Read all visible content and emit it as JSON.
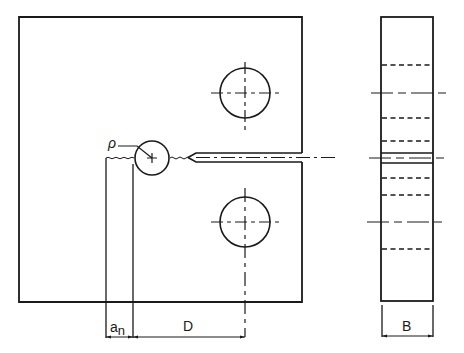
{
  "diagram": {
    "type": "technical-drawing",
    "views": [
      "front-view",
      "side-view"
    ],
    "colors": {
      "line": "#1a1a1a",
      "background": "#ffffff"
    }
  },
  "labels": {
    "notch_radius": "ρ",
    "notch_depth_main": "a",
    "notch_depth_sub": "n",
    "ligament": "D",
    "thickness": "B"
  }
}
